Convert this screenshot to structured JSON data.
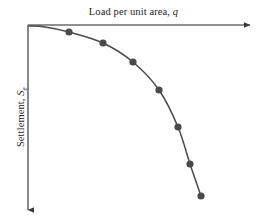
{
  "figure": {
    "x_axis_label_prefix": "Load per unit area, ",
    "x_axis_label_symbol": "q",
    "y_axis_label_prefix": "Settlement, ",
    "y_axis_label_symbol": "S",
    "y_axis_label_subscript": "e",
    "curve_color": "#4a4a4a",
    "marker_color": "#4a4a4a",
    "axis_color": "#6b6b6b",
    "background_color": "#ffffff"
  },
  "chart_data": {
    "type": "line",
    "title": "Load per unit area, q",
    "xlabel": "Load per unit area, q",
    "ylabel": "Settlement, Se",
    "grid": false,
    "legend": "none",
    "axis_orientation": "x-axis at top pointing right, y-axis at left pointing down (settlement increases downward)",
    "axis_arrows": true,
    "tick_labels": [],
    "origin": {
      "x": 28,
      "y": 25
    },
    "x_axis_end": {
      "x": 255,
      "y": 25
    },
    "y_axis_end": {
      "x": 28,
      "y": 215
    },
    "xlim": [
      28,
      255
    ],
    "ylim": [
      25,
      215
    ],
    "series": [
      {
        "name": "Load-settlement curve",
        "marker": "filled-circle",
        "x": [
          69,
          103,
          133,
          159,
          178,
          190,
          201
        ],
        "y": [
          32,
          43,
          62,
          90,
          127,
          164,
          196
        ],
        "curve_path_points": [
          {
            "x": 29,
            "y": 26
          },
          {
            "x": 45,
            "y": 27
          },
          {
            "x": 69,
            "y": 32
          },
          {
            "x": 103,
            "y": 43
          },
          {
            "x": 133,
            "y": 62
          },
          {
            "x": 159,
            "y": 90
          },
          {
            "x": 178,
            "y": 127
          },
          {
            "x": 190,
            "y": 164
          },
          {
            "x": 201,
            "y": 196
          }
        ]
      }
    ]
  }
}
